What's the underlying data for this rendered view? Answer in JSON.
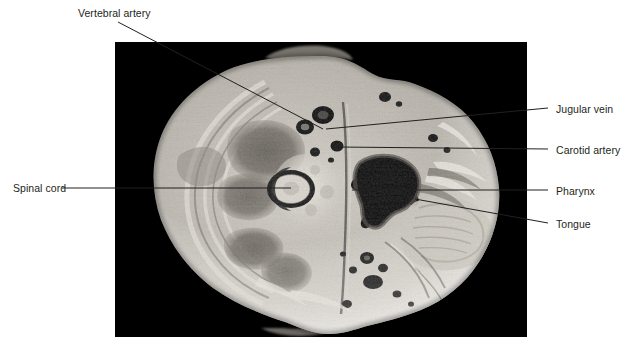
{
  "figure": {
    "type": "anatomical-cross-section",
    "plate": {
      "background_color": "#000000",
      "left": 115,
      "top": 42,
      "width": 412,
      "height": 295
    },
    "text_color": "#231f20",
    "leader_color": "#231f20"
  },
  "labels": [
    {
      "id": "vertebral-artery",
      "text": "Vertebral artery",
      "side": "top-left",
      "label_x": 78,
      "label_y": 7,
      "leader": {
        "x1": 118,
        "y1": 22,
        "x2": 323,
        "y2": 129
      }
    },
    {
      "id": "spinal-cord",
      "text": "Spinal cord",
      "side": "left",
      "label_x": 13,
      "label_y": 182,
      "leader": {
        "x1": 62,
        "y1": 188,
        "x2": 291,
        "y2": 188
      }
    },
    {
      "id": "jugular-vein",
      "text": "Jugular vein",
      "side": "right",
      "label_x": 556,
      "label_y": 103,
      "leader": {
        "x1": 326,
        "y1": 129,
        "x2": 548,
        "y2": 108
      }
    },
    {
      "id": "carotid-artery",
      "text": "Carotid artery",
      "side": "right",
      "label_x": 556,
      "label_y": 144,
      "leader": {
        "x1": 337,
        "y1": 147,
        "x2": 548,
        "y2": 149
      }
    },
    {
      "id": "pharynx",
      "text": "Pharynx",
      "side": "right",
      "label_x": 556,
      "label_y": 185,
      "leader": {
        "x1": 352,
        "y1": 190,
        "x2": 548,
        "y2": 190
      }
    },
    {
      "id": "tongue",
      "text": "Tongue",
      "side": "right",
      "label_x": 556,
      "label_y": 218,
      "leader": {
        "x1": 415,
        "y1": 199,
        "x2": 548,
        "y2": 223
      }
    }
  ]
}
